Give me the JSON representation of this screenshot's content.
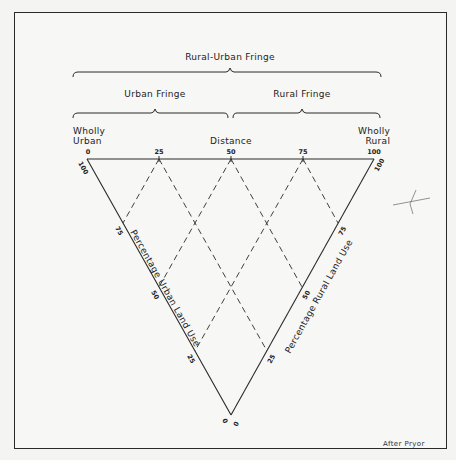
{
  "figure": {
    "brackets": {
      "outer": "Rural-Urban Fringe",
      "left": "Urban Fringe",
      "right": "Rural Fringe"
    },
    "top_axis": {
      "left_end_label": [
        "Wholly",
        "Urban"
      ],
      "center_label": "Distance",
      "right_end_label": [
        "Wholly",
        "Rural"
      ],
      "ticks": [
        "0",
        "25",
        "50",
        "75",
        "100"
      ]
    },
    "left_axis": {
      "label": "Percentage Urban Land Use",
      "ticks": [
        "100",
        "75",
        "50",
        "25",
        "0"
      ]
    },
    "right_axis": {
      "label": "Percentage Rural Land Use",
      "ticks": [
        "100",
        "75",
        "50",
        "25",
        "0"
      ]
    },
    "credit": "After Pryor"
  },
  "colors": {
    "line": "#2a2a2a",
    "background": "#f7f7f5"
  }
}
